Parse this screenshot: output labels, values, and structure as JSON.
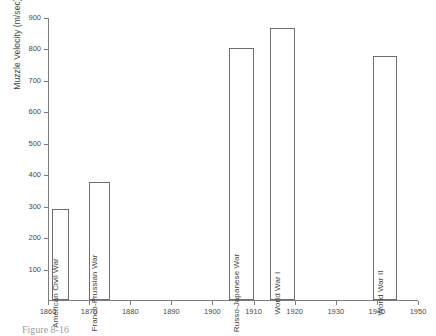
{
  "caption": "Figure 8-16",
  "chart_data": {
    "type": "bar",
    "title": "",
    "xlabel": "",
    "ylabel": "Muzzle Velocity (m/sec)",
    "xlim": [
      1860,
      1950
    ],
    "ylim": [
      0,
      900
    ],
    "grid": false,
    "legend": null,
    "xticks": [
      1860,
      1870,
      1880,
      1890,
      1900,
      1910,
      1920,
      1930,
      1940,
      1950
    ],
    "xtick_labels": [
      "1860",
      "1870",
      "1880",
      "1890",
      "1900",
      "1910",
      "1920",
      "1930",
      "1940",
      "1950"
    ],
    "yticks": [
      100,
      200,
      300,
      400,
      500,
      600,
      700,
      800,
      900
    ],
    "ytick_labels": [
      "100",
      "200",
      "300",
      "400",
      "500",
      "600",
      "700",
      "800",
      "900"
    ],
    "categories": [
      "American Civil War",
      "Franco-Prussian War",
      "Russo-Japanese War",
      "World War I",
      "World War II"
    ],
    "values": [
      290,
      375,
      800,
      865,
      775
    ],
    "bars": [
      {
        "label": "American Civil War",
        "value": 290,
        "x_start": 1861,
        "x_end": 1865
      },
      {
        "label": "Franco-Prussian War",
        "value": 375,
        "x_start": 1870,
        "x_end": 1875
      },
      {
        "label": "Russo-Japanese War",
        "value": 800,
        "x_start": 1904,
        "x_end": 1910
      },
      {
        "label": "World War I",
        "value": 865,
        "x_start": 1914,
        "x_end": 1920
      },
      {
        "label": "World War II",
        "value": 775,
        "x_start": 1939,
        "x_end": 1945
      }
    ],
    "colors": {
      "bar_fill": "#ffffff",
      "bar_edge": "#6e6e6e",
      "axis": "#7d7d7d",
      "text": "#3f3f3f",
      "background": "#ffffff"
    }
  }
}
